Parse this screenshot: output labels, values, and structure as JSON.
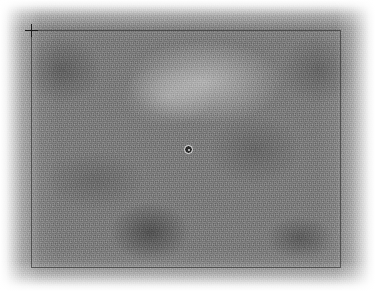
{
  "viewer": {
    "width": 291,
    "height": 375,
    "background_color": "#ffffff",
    "field_mean_color": "#7d7d7d",
    "description": "Grayscale noise field image with overlay annotations"
  },
  "overlays": {
    "region_frame": {
      "label": "region-frame",
      "x": 31,
      "y": 30,
      "width": 310,
      "height": 238,
      "stroke_color": "#282828"
    },
    "crosshair_marker": {
      "label": "crosshair-marker",
      "x": 31,
      "y": 30,
      "size": 13,
      "color": "#1b1b1b"
    },
    "source_marker": {
      "label": "source-marker",
      "x": 188,
      "y": 149,
      "radius": 4,
      "ring_color": "#f2f2f2",
      "core_color": "#2b2b2b"
    }
  },
  "accessibility": {
    "viewer_alt": "Grayscale noisy image field with a rectangular selection frame, a crosshair at its top-left corner and a small circular source marker near the centre."
  }
}
